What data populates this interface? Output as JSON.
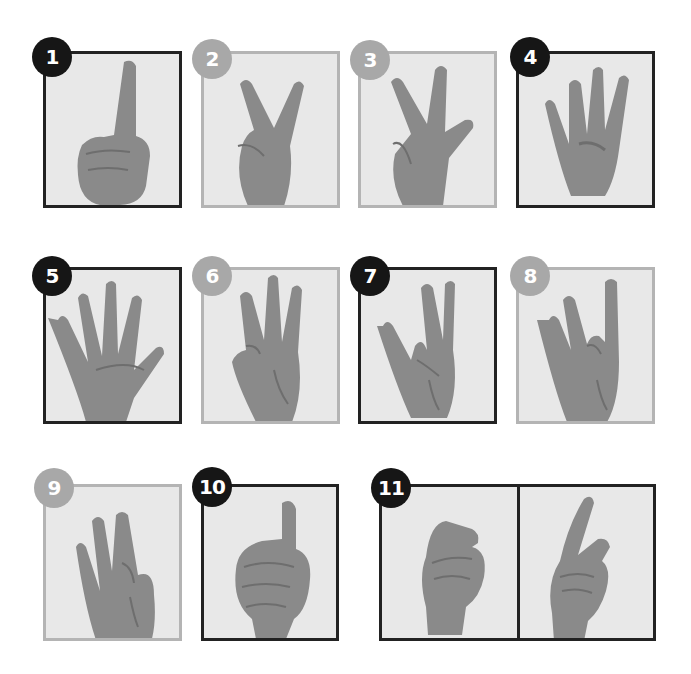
{
  "colors": {
    "dark_frame": "#222222",
    "light_frame": "#b4b4b4",
    "dark_badge": "#161616",
    "light_badge": "#a8a8a8",
    "panel_bg": "#e8e8e8",
    "skin": "#8a8a8a"
  },
  "gestures": [
    {
      "number": "1",
      "style": "dark",
      "description": "index finger raised, fist"
    },
    {
      "number": "2",
      "style": "light",
      "description": "index and middle fingers in V"
    },
    {
      "number": "3",
      "style": "light",
      "description": "thumb, index and middle extended"
    },
    {
      "number": "4",
      "style": "dark",
      "description": "four fingers raised, thumb folded"
    },
    {
      "number": "5",
      "style": "dark",
      "description": "open palm, five fingers"
    },
    {
      "number": "6",
      "style": "light",
      "description": "three fingers raised, thumb touching pinky"
    },
    {
      "number": "7",
      "style": "dark",
      "description": "thumb touching ring finger"
    },
    {
      "number": "8",
      "style": "light",
      "description": "thumb touching middle finger"
    },
    {
      "number": "9",
      "style": "light",
      "description": "thumb touching index finger"
    },
    {
      "number": "10",
      "style": "dark",
      "description": "thumbs up, fist"
    },
    {
      "number": "11",
      "style": "dark",
      "description": "two-part: flick then index pointing"
    }
  ]
}
